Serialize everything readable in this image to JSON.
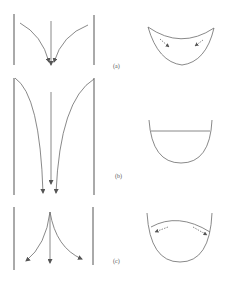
{
  "figure": {
    "panels": [
      {
        "id": "a",
        "label": "(a)",
        "description": "Flow converging toward the centre; surface depressed at centre",
        "flow_arrows": "inward-converging",
        "surface_shape": "concave-sag",
        "surface_arrows": "inward"
      },
      {
        "id": "b",
        "label": "(b)",
        "description": "Parallel downward flow; flat free surface",
        "flow_arrows": "parallel-downward",
        "surface_shape": "flat",
        "surface_arrows": "none"
      },
      {
        "id": "c",
        "label": "(c)",
        "description": "Flow diverging from the centre; surface raised at centre",
        "flow_arrows": "outward-diverging",
        "surface_shape": "convex-dome",
        "surface_arrows": "outward"
      }
    ],
    "colors": {
      "line": "#6b6b6b",
      "wall": "#555555",
      "background": "#ffffff"
    }
  }
}
